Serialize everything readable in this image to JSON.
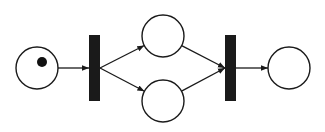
{
  "diagram": {
    "type": "petri-net",
    "colors": {
      "stroke": "#1a1a1a",
      "fill_place": "#ffffff",
      "transition": "#1a1a1a",
      "token": "#111111",
      "background": "#ffffff"
    },
    "places": [
      {
        "id": "p1",
        "cx": 37,
        "cy": 68,
        "r": 21,
        "tokens": 1
      },
      {
        "id": "p2",
        "cx": 163,
        "cy": 36,
        "r": 21,
        "tokens": 0
      },
      {
        "id": "p3",
        "cx": 163,
        "cy": 101,
        "r": 21,
        "tokens": 0
      },
      {
        "id": "p4",
        "cx": 289,
        "cy": 68,
        "r": 21,
        "tokens": 0
      }
    ],
    "transitions": [
      {
        "id": "t1",
        "x": 89,
        "y": 35,
        "w": 11,
        "h": 66
      },
      {
        "id": "t2",
        "x": 225,
        "y": 35,
        "w": 11,
        "h": 66
      }
    ],
    "arcs": [
      {
        "from": "p1",
        "to": "t1"
      },
      {
        "from": "t1",
        "to": "p2"
      },
      {
        "from": "t1",
        "to": "p3"
      },
      {
        "from": "p2",
        "to": "t2"
      },
      {
        "from": "p3",
        "to": "t2"
      },
      {
        "from": "t2",
        "to": "p4"
      }
    ]
  }
}
